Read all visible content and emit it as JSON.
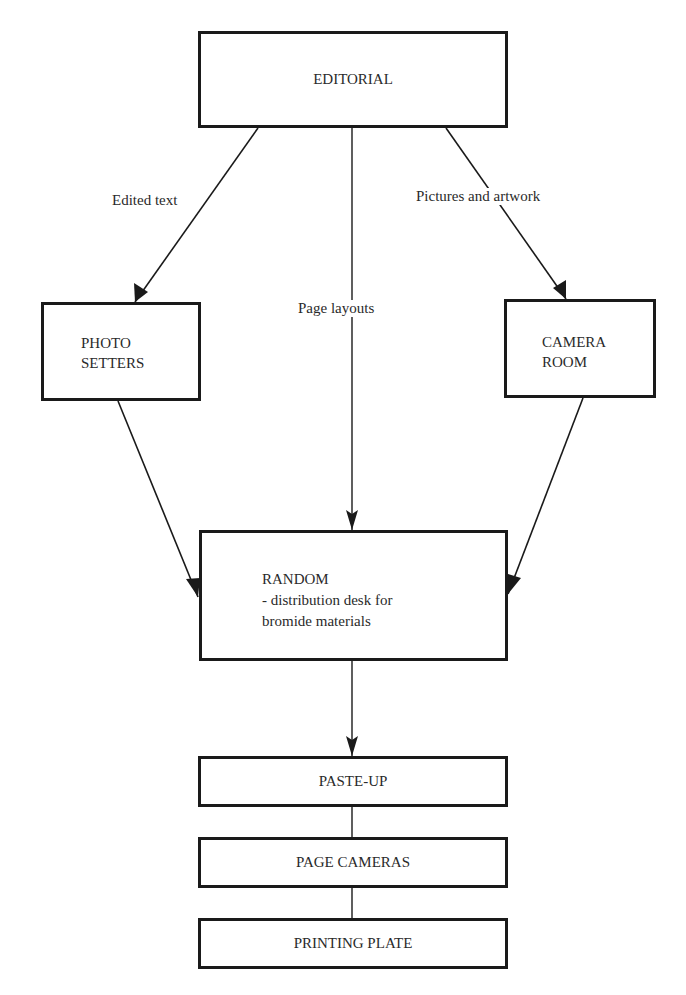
{
  "diagram": {
    "type": "flowchart",
    "nodes": {
      "editorial": {
        "label": "EDITORIAL"
      },
      "photo_setters": {
        "line1": "PHOTO",
        "line2": "SETTERS"
      },
      "camera_room": {
        "line1": "CAMERA",
        "line2": "ROOM"
      },
      "random": {
        "line1": "RANDOM",
        "line2": "- distribution desk for",
        "line3": "bromide materials"
      },
      "paste_up": {
        "label": "PASTE-UP"
      },
      "page_cameras": {
        "label": "PAGE CAMERAS"
      },
      "printing_plate": {
        "label": "PRINTING PLATE"
      }
    },
    "edges": {
      "editorial_to_photo_setters": {
        "label": "Edited text"
      },
      "editorial_to_random": {
        "label": "Page layouts"
      },
      "editorial_to_camera_room": {
        "label": "Pictures and artwork"
      }
    }
  }
}
